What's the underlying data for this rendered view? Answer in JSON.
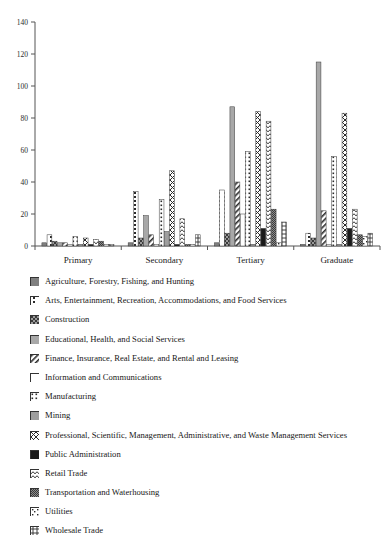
{
  "chart_data": {
    "type": "bar",
    "title": "",
    "subtitle": "",
    "xlabel": "",
    "ylabel": "",
    "ylim": [
      0,
      140
    ],
    "ytick_values": [
      0,
      20,
      40,
      60,
      80,
      100,
      120,
      140
    ],
    "ytick_labels": [
      "0",
      "20",
      "40",
      "60",
      "80",
      "100",
      "120",
      "140"
    ],
    "grid": false,
    "legend_position": "below",
    "categories": [
      "Primary",
      "Secondary",
      "Tertiary",
      "Graduate"
    ],
    "series": [
      {
        "name": "Agriculture, Forestry, Fishing, and Hunting",
        "pattern": "solid-gray",
        "color": "#808080",
        "values": [
          2,
          2,
          2,
          1
        ]
      },
      {
        "name": "Arts, Entertainment, Recreation, Accommodations, and Food Services",
        "pattern": "dotted-vertical",
        "color": "#ffffff",
        "values": [
          7,
          34,
          35,
          8
        ]
      },
      {
        "name": "Construction",
        "pattern": "checker-diagonal",
        "color": "#9a9a9a",
        "values": [
          3,
          5,
          8,
          5
        ]
      },
      {
        "name": "Educational, Health, and Social Services",
        "pattern": "solid-light-gray",
        "color": "#a8a8a8",
        "values": [
          2,
          19,
          87,
          115
        ]
      },
      {
        "name": "Finance, Insurance, Real Estate, and Rental and Leasing",
        "pattern": "diagonal-stripe",
        "color": "#ffffff",
        "values": [
          2,
          7,
          40,
          22
        ]
      },
      {
        "name": "Information and Communications",
        "pattern": "open-white",
        "color": "#ffffff",
        "values": [
          1,
          1,
          20,
          1
        ]
      },
      {
        "name": "Manufacturing",
        "pattern": "dotted-dense",
        "color": "#ffffff",
        "values": [
          6,
          29,
          59,
          56
        ]
      },
      {
        "name": "Mining",
        "pattern": "solid-medium-gray",
        "color": "#9e9e9e",
        "values": [
          1,
          9,
          1,
          1
        ]
      },
      {
        "name": "Professional, Scientific, Management, Administrative, and Waste Management Services",
        "pattern": "cross-diagonal",
        "color": "#ffffff",
        "values": [
          5,
          47,
          84,
          83
        ]
      },
      {
        "name": "Public Administration",
        "pattern": "solid-black",
        "color": "#1a1a1a",
        "values": [
          1,
          1,
          11,
          11
        ]
      },
      {
        "name": "Retail Trade",
        "pattern": "wave-diagonal",
        "color": "#ffffff",
        "values": [
          4,
          17,
          78,
          23
        ]
      },
      {
        "name": "Transportation and Waterhousing",
        "pattern": "fine-checker",
        "color": "#8c8c8c",
        "values": [
          3,
          1,
          23,
          7
        ]
      },
      {
        "name": "Utilities",
        "pattern": "box-dots",
        "color": "#ffffff",
        "values": [
          1,
          1,
          2,
          6
        ]
      },
      {
        "name": "Wholesale Trade",
        "pattern": "grid-cross",
        "color": "#ffffff",
        "values": [
          1,
          7,
          15,
          8
        ]
      }
    ]
  },
  "legend": {
    "items": [
      {
        "label": "Agriculture, Forestry, Fishing, and Hunting"
      },
      {
        "label": "Arts, Entertainment, Recreation, Accommodations, and Food Services"
      },
      {
        "label": "Construction"
      },
      {
        "label": "Educational, Health, and Social Services"
      },
      {
        "label": "Finance, Insurance, Real Estate, and Rental and Leasing"
      },
      {
        "label": "Information and Communications"
      },
      {
        "label": "Manufacturing"
      },
      {
        "label": "Mining"
      },
      {
        "label": "Professional, Scientific, Management, Administrative, and Waste Management Services"
      },
      {
        "label": "Public Administration"
      },
      {
        "label": "Retail Trade"
      },
      {
        "label": "Transportation and Waterhousing"
      },
      {
        "label": "Utilities"
      },
      {
        "label": "Wholesale Trade"
      }
    ]
  }
}
